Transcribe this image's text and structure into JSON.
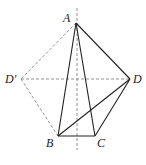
{
  "diagram": {
    "type": "geometry",
    "points": {
      "A": {
        "label": "A",
        "x": 76,
        "y": 23
      },
      "B": {
        "label": "B",
        "x": 58,
        "y": 136
      },
      "C": {
        "label": "C",
        "x": 95,
        "y": 136
      },
      "D": {
        "label": "D",
        "x": 130,
        "y": 79
      },
      "D_prime": {
        "label": "D′",
        "x": 21,
        "y": 79
      }
    },
    "solid_segments": [
      "AB",
      "AC",
      "AD",
      "BC",
      "BD",
      "CD"
    ],
    "dashed_segments": [
      "AD′",
      "D′B",
      "D′D",
      "axis"
    ],
    "axis": {
      "x": 77,
      "y1": 8,
      "y2": 150
    },
    "colors": {
      "solid": "#222222",
      "dashed": "#777777"
    }
  }
}
